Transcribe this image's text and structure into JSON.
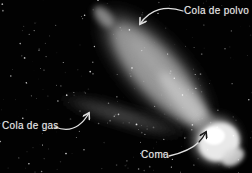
{
  "figure": {
    "annotations": {
      "dust_tail": {
        "label": "Cola de polvo"
      },
      "gas_tail": {
        "label": "Cola de gas"
      },
      "coma": {
        "label": "Coma"
      }
    },
    "colors": {
      "background": "#020202",
      "label_text": "#ececec",
      "arrow": "#e0e0e0",
      "coma_arrowhead": "#1a1a1a",
      "dust_tail_gray": "#9a9a9a",
      "gas_tail_gray": "#3d3d3d",
      "coma_white": "#ffffff"
    },
    "icons": {
      "dust_tail_arrow": "curved-arrow",
      "gas_tail_arrow": "curved-arrow",
      "coma_arrow": "curved-arrow"
    }
  }
}
